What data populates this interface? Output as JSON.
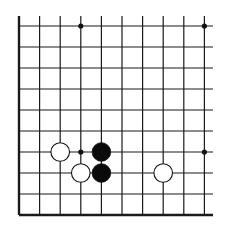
{
  "board": {
    "type": "go-diagram-fragment",
    "visible_columns": 10,
    "visible_rows": 10,
    "edges": {
      "left": true,
      "bottom": true,
      "top": false,
      "right": false
    },
    "origin_x": 19,
    "origin_y": 26,
    "spacing_x": 20.6,
    "spacing_y": 21,
    "line_color": "#1a1a1a",
    "background": "#ffffff"
  },
  "star_points": [
    {
      "col": 3,
      "row": 0
    },
    {
      "col": 9,
      "row": 0
    },
    {
      "col": 3,
      "row": 6
    },
    {
      "col": 9,
      "row": 6
    }
  ],
  "stones": [
    {
      "color": "white",
      "col": 2,
      "row": 6
    },
    {
      "color": "white",
      "col": 3,
      "row": 7
    },
    {
      "color": "white",
      "col": 7,
      "row": 7
    },
    {
      "color": "black",
      "col": 4,
      "row": 6
    },
    {
      "color": "black",
      "col": 4,
      "row": 7
    }
  ]
}
